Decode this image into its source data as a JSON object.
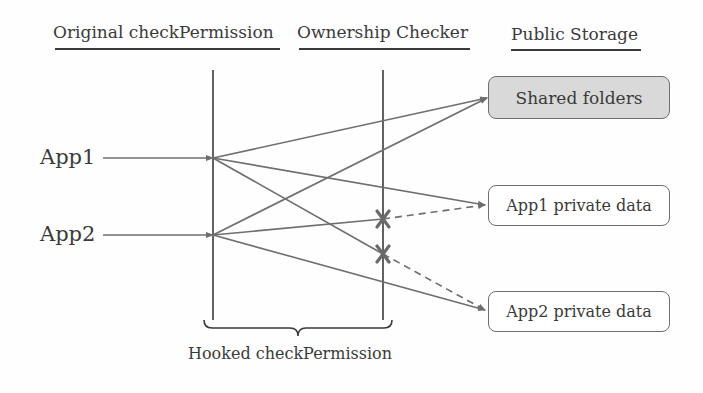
{
  "headers": {
    "original": "Original checkPermission",
    "checker": "Ownership Checker",
    "storage": "Public Storage"
  },
  "apps": [
    {
      "label": "App1"
    },
    {
      "label": "App2"
    }
  ],
  "storage_boxes": [
    {
      "label": "Shared folders",
      "shaded": true
    },
    {
      "label": "App1 private data",
      "shaded": false
    },
    {
      "label": "App2 private data",
      "shaded": false
    }
  ],
  "connections": [
    {
      "from": "App1",
      "to": "Shared folders",
      "style": "solid",
      "blocked": false
    },
    {
      "from": "App1",
      "to": "App1 private data",
      "style": "solid",
      "blocked": false
    },
    {
      "from": "App1",
      "to": "App2 private data",
      "style": "dashed",
      "blocked": true
    },
    {
      "from": "App2",
      "to": "Shared folders",
      "style": "solid",
      "blocked": false
    },
    {
      "from": "App2",
      "to": "App1 private data",
      "style": "dashed",
      "blocked": true
    },
    {
      "from": "App2",
      "to": "App2 private data",
      "style": "solid",
      "blocked": false
    }
  ],
  "brace_label": "Hooked checkPermission",
  "colors": {
    "line": "#6e6e6e",
    "text": "#3a3a3a",
    "shared_fill": "#d9d9d9",
    "block_mark": "#6a6a6a"
  }
}
